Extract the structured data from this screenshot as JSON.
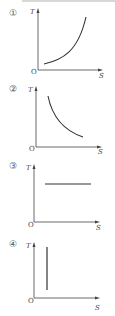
{
  "graphs": [
    {
      "label": "①",
      "y_axis": "T",
      "x_axis": "S",
      "origin": "O",
      "curve": "increasing-convex"
    },
    {
      "label": "②",
      "y_axis": "T",
      "x_axis": "S",
      "origin": "O",
      "curve": "decreasing-convex"
    },
    {
      "label": "③",
      "y_axis": "T",
      "x_axis": "S",
      "origin": "O",
      "curve": "horizontal-line"
    },
    {
      "label": "④",
      "y_axis": "T",
      "x_axis": "S",
      "origin": "O",
      "curve": "vertical-line"
    }
  ]
}
